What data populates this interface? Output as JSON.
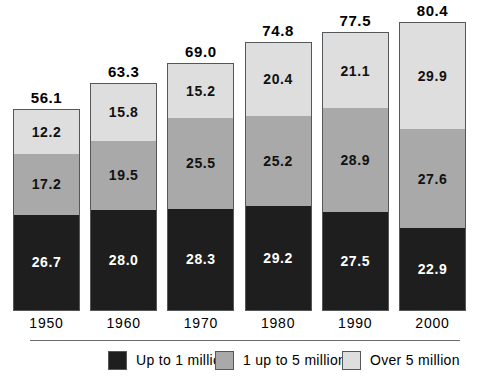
{
  "chart_data": {
    "type": "bar",
    "subtype": "stacked-bar",
    "title": "",
    "xlabel": "",
    "ylabel": "",
    "grid": false,
    "ylim": [
      0,
      80.4
    ],
    "axis_visible": false,
    "legend_position": "bottom",
    "categories": [
      "1950",
      "1960",
      "1970",
      "1980",
      "1990",
      "2000"
    ],
    "series": [
      {
        "name": "Up to 1 million",
        "color": "#1e1e1e",
        "values": [
          26.7,
          28.0,
          28.3,
          29.2,
          27.5,
          22.9
        ],
        "labels": [
          "26.7",
          "28.0",
          "28.3",
          "29.2",
          "27.5",
          "22.9"
        ]
      },
      {
        "name": "1 up to 5 million",
        "color": "#a9a9a9",
        "values": [
          17.2,
          19.5,
          25.5,
          25.2,
          28.9,
          27.6
        ],
        "labels": [
          "17.2",
          "19.5",
          "25.5",
          "25.2",
          "28.9",
          "27.6"
        ]
      },
      {
        "name": "Over 5 million",
        "color": "#dedede",
        "values": [
          12.2,
          15.8,
          15.2,
          20.4,
          21.1,
          29.9
        ],
        "labels": [
          "12.2",
          "15.8",
          "15.2",
          "20.4",
          "21.1",
          "29.9"
        ]
      }
    ],
    "totals": [
      56.1,
      63.3,
      69.0,
      74.8,
      77.5,
      80.4
    ],
    "total_labels": [
      "56.1",
      "63.3",
      "69.0",
      "74.8",
      "77.5",
      "80.4"
    ]
  },
  "legend": {
    "items": [
      {
        "label": "Up to 1 million",
        "color": "#1e1e1e"
      },
      {
        "label": "1 up to 5 million",
        "color": "#a9a9a9"
      },
      {
        "label": "Over 5 million",
        "color": "#dedede"
      }
    ]
  },
  "colors": {
    "upto1": "#1e1e1e",
    "one_to_five": "#a9a9a9",
    "over5": "#dedede",
    "bar_border": "#55585a",
    "rule": "#6a6d6f",
    "background": "#ffffff",
    "text": "#000000",
    "text_on_dark": "#ffffff"
  }
}
